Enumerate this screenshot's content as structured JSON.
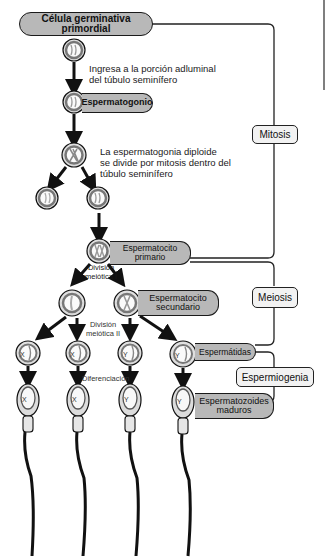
{
  "diagram": {
    "nodes": {
      "pgc": "Célula germinativa primordial",
      "spermatogonium": "Espermatogonio",
      "primary_spermatocyte_line1": "Espermatocito",
      "primary_spermatocyte_line2": "primario",
      "secondary_spermatocyte_line1": "Espermatocito",
      "secondary_spermatocyte_line2": "secundario",
      "spermatids": "Espermátidas",
      "mature_sperm_line1": "Espermatozoides",
      "mature_sperm_line2": "maduros"
    },
    "annotations": {
      "enter_line1": "Ingresa a la porción adluminal",
      "enter_line2": "del túbulo seminífero",
      "mitosis_line1": "La espermatogonia diploide",
      "mitosis_line2": "se divide por mitosis dentro del",
      "mitosis_line3": "túbulo seminífero",
      "meiosis1_line1": "División",
      "meiosis1_line2": "meiótica I",
      "meiosis2_line1": "División",
      "meiosis2_line2": "meiótica II",
      "differentiation": "Diferenciación"
    },
    "phases": {
      "mitosis": "Mitosis",
      "meiosis": "Meiosis",
      "spermiogenesis": "Espermiogenia"
    },
    "chromosome_labels": [
      "X",
      "X",
      "Y",
      "Y"
    ],
    "colors": {
      "pill_fill": "#b8b8b8",
      "box_fill": "#f2f2f2",
      "cell_ring": "#8c8c8c",
      "line": "#1a1a1a"
    }
  }
}
